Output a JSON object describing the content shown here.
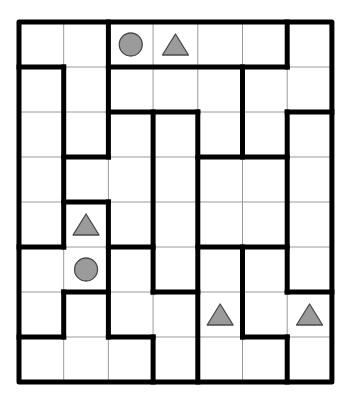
{
  "puzzle": {
    "title": "Region puzzle grid",
    "rows": 8,
    "cols": 7,
    "origin": {
      "x": 19,
      "y": 22
    },
    "cell_w": 44.7,
    "cell_h": 45,
    "colors": {
      "background": "#ffffff",
      "thin_line": "#9a9a9a",
      "thick_line": "#000000",
      "shape_fill": "#9b9b9b",
      "shape_stroke": "#4a4a4a"
    },
    "thick_horizontal": [
      {
        "row": 1,
        "from": 0,
        "to": 1
      },
      {
        "row": 1,
        "from": 2,
        "to": 6
      },
      {
        "row": 2,
        "from": 2,
        "to": 4
      },
      {
        "row": 2,
        "from": 6,
        "to": 7
      },
      {
        "row": 3,
        "from": 1,
        "to": 2
      },
      {
        "row": 3,
        "from": 4,
        "to": 6
      },
      {
        "row": 4,
        "from": 1,
        "to": 2
      },
      {
        "row": 5,
        "from": 0,
        "to": 1
      },
      {
        "row": 5,
        "from": 2,
        "to": 3
      },
      {
        "row": 5,
        "from": 4,
        "to": 6
      },
      {
        "row": 6,
        "from": 1,
        "to": 2
      },
      {
        "row": 6,
        "from": 3,
        "to": 4
      },
      {
        "row": 6,
        "from": 6,
        "to": 7
      },
      {
        "row": 7,
        "from": 0,
        "to": 1
      },
      {
        "row": 7,
        "from": 2,
        "to": 3
      },
      {
        "row": 7,
        "from": 5,
        "to": 6
      }
    ],
    "thick_vertical": [
      {
        "col": 1,
        "from": 1,
        "to": 5
      },
      {
        "col": 1,
        "from": 6,
        "to": 7
      },
      {
        "col": 2,
        "from": 0,
        "to": 3
      },
      {
        "col": 2,
        "from": 4,
        "to": 7
      },
      {
        "col": 3,
        "from": 2,
        "to": 6
      },
      {
        "col": 3,
        "from": 7,
        "to": 8
      },
      {
        "col": 4,
        "from": 2,
        "to": 8
      },
      {
        "col": 5,
        "from": 1,
        "to": 3
      },
      {
        "col": 5,
        "from": 5,
        "to": 7
      },
      {
        "col": 6,
        "from": 0,
        "to": 1
      },
      {
        "col": 6,
        "from": 2,
        "to": 6
      },
      {
        "col": 6,
        "from": 7,
        "to": 8
      }
    ],
    "shapes": [
      {
        "type": "circle",
        "row": 0,
        "col": 2
      },
      {
        "type": "triangle",
        "row": 0,
        "col": 3
      },
      {
        "type": "triangle",
        "row": 4,
        "col": 1
      },
      {
        "type": "circle",
        "row": 5,
        "col": 1
      },
      {
        "type": "triangle",
        "row": 6,
        "col": 4
      },
      {
        "type": "triangle",
        "row": 6,
        "col": 6
      }
    ]
  }
}
